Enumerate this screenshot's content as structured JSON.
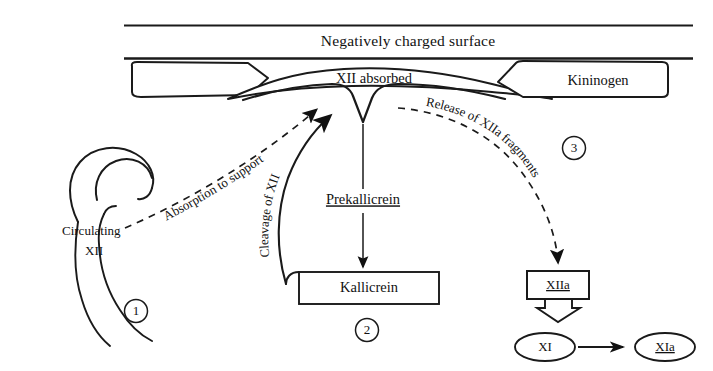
{
  "figure": {
    "background_color": "#ffffff",
    "ink_color": "#1a1a1a"
  },
  "surface": {
    "label": "Negatively charged surface"
  },
  "nodes": {
    "left_block": {
      "label": ""
    },
    "xii_absorbed": {
      "label": "XII absorbed"
    },
    "kininogen": {
      "label": "Kininogen"
    },
    "circulating_xii": {
      "label_line1": "Circulating",
      "label_line2": "XII"
    },
    "prekallicrein": {
      "label": "Prekallicrein"
    },
    "kallicrein": {
      "label": "Kallicrein"
    },
    "xiia": {
      "label": "XIIa"
    },
    "xi": {
      "label": "XI"
    },
    "xia": {
      "label": "XIa"
    }
  },
  "arrow_labels": {
    "absorption": "Absorption to support",
    "cleavage": "Cleavage of XII",
    "release": "Release of XIIa fragments"
  },
  "step_markers": [
    {
      "number": "1"
    },
    {
      "number": "2"
    },
    {
      "number": "3"
    }
  ]
}
